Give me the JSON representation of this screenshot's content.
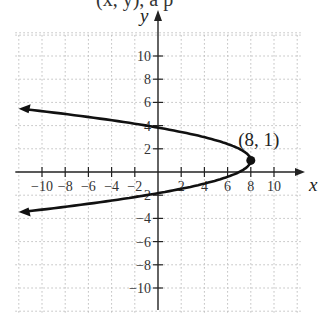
{
  "header_fragment": "(x, y), a p",
  "chart_data": {
    "type": "line",
    "title": "",
    "xlabel": "x",
    "ylabel": "y",
    "xlim": [
      -12,
      12
    ],
    "ylim": [
      -12,
      12
    ],
    "grid": true,
    "x_ticks": [
      -10,
      -8,
      -6,
      -4,
      -2,
      2,
      4,
      6,
      8,
      10
    ],
    "y_ticks": [
      -10,
      -8,
      -6,
      -4,
      -2,
      2,
      4,
      6,
      8,
      10
    ],
    "x_tick_labels": [
      "−10",
      "−8",
      "−6",
      "−4",
      "−2",
      "2",
      "4",
      "6",
      "8",
      "10"
    ],
    "y_tick_labels": [
      "−10",
      "−8",
      "−6",
      "−4",
      "−2",
      "2",
      "4",
      "6",
      "8",
      "10"
    ],
    "series": [
      {
        "name": "x = -(y - 1)^2 + 8",
        "description": "Horizontal parabola opening left with vertex (8, 1), arrows on both ends",
        "points": [
          {
            "x": -11.5,
            "y": 5.42
          },
          {
            "x": 0,
            "y": 3.83
          },
          {
            "x": 4,
            "y": 3
          },
          {
            "x": 7,
            "y": 2
          },
          {
            "x": 8,
            "y": 1
          },
          {
            "x": 7,
            "y": 0
          },
          {
            "x": 4,
            "y": -1
          },
          {
            "x": 0,
            "y": -1.83
          },
          {
            "x": -11.5,
            "y": -3.42
          }
        ]
      }
    ],
    "annotations": [
      {
        "text": "(8, 1)",
        "x": 8,
        "y": 1,
        "marker": "filled-circle"
      }
    ]
  },
  "layout": {
    "origin_px": [
      158,
      172
    ],
    "unit_px": 11.6,
    "grid_color": "#bdbdbd",
    "axis_color": "#222222",
    "curve_color": "#111111"
  }
}
